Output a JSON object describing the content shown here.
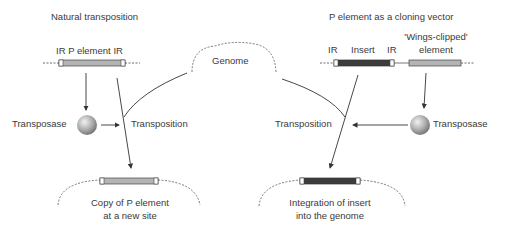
{
  "left_panel": {
    "title": "Natural transposition",
    "element_label": "IR P element IR",
    "transposase_label": "Transposase",
    "transposition_label": "Transposition",
    "result_line1": "Copy of P element",
    "result_line2": "at a new site"
  },
  "center": {
    "genome_label": "Genome"
  },
  "right_panel": {
    "title": "P element as a cloning vector",
    "ir_left": "IR",
    "insert_label": "Insert",
    "ir_right": "IR",
    "wings_line1": "'Wings-clipped'",
    "wings_line2": "element",
    "transposition_label": "Transposition",
    "transposase_label": "Transposase",
    "result_line1": "Integration of insert",
    "result_line2": "into the genome"
  },
  "colors": {
    "p_element": "#b4b4b4",
    "insert": "#3c3c3c",
    "line": "#333333",
    "sphere_light": "#e6e6e6",
    "sphere_dark": "#7a7a7a"
  }
}
